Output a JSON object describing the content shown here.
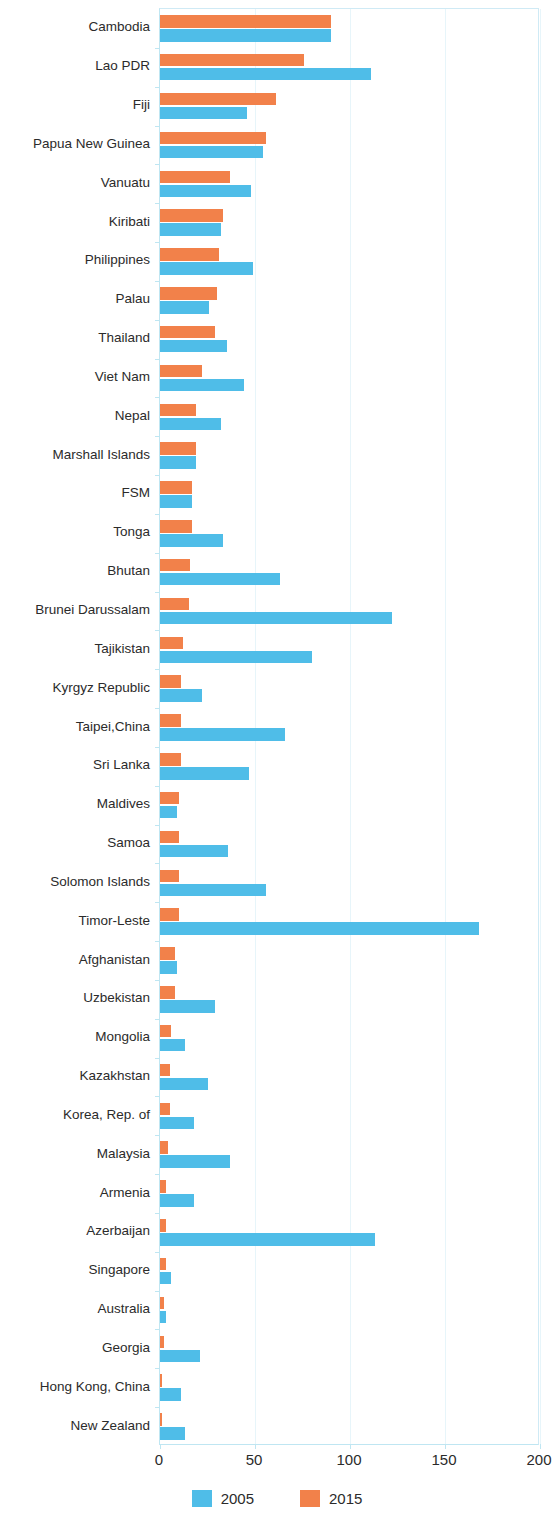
{
  "chart_data": {
    "type": "bar",
    "orientation": "horizontal",
    "title": "",
    "subtitle": "",
    "xlabel": "",
    "ylabel": "",
    "xlim": [
      0,
      200
    ],
    "xticks": [
      0,
      50,
      100,
      150,
      200
    ],
    "xtick_labels": [
      "0",
      "50",
      "100",
      "150",
      "200"
    ],
    "grid": true,
    "legend_position": "bottom-center",
    "colors": {
      "2005": "#4fbde8",
      "2015": "#f2814a",
      "axis": "#bfe6f2",
      "grid": "#e7f5fa",
      "text": "#2b2b2b"
    },
    "categories": [
      "Cambodia",
      "Lao PDR",
      "Fiji",
      "Papua New Guinea",
      "Vanuatu",
      "Kiribati",
      "Philippines",
      "Palau",
      "Thailand",
      "Viet Nam",
      "Nepal",
      "Marshall Islands",
      "FSM",
      "Tonga",
      "Bhutan",
      "Brunei Darussalam",
      "Tajikistan",
      "Kyrgyz Republic",
      "Taipei,China",
      "Sri Lanka",
      "Maldives",
      "Samoa",
      "Solomon Islands",
      "Timor-Leste",
      "Afghanistan",
      "Uzbekistan",
      "Mongolia",
      "Kazakhstan",
      "Korea, Rep. of",
      "Malaysia",
      "Armenia",
      "Azerbaijan",
      "Singapore",
      "Australia",
      "Georgia",
      "Hong Kong, China",
      "New Zealand"
    ],
    "series": [
      {
        "name": "2015",
        "color": "#f2814a",
        "values": [
          90,
          76,
          61,
          56,
          37,
          33,
          31,
          30,
          29,
          22,
          19,
          19,
          17,
          17,
          16,
          15,
          12,
          11,
          11,
          11,
          10,
          10,
          10,
          10,
          8,
          8,
          6,
          5,
          5,
          4,
          3,
          3,
          3,
          2,
          2,
          1,
          1
        ]
      },
      {
        "name": "2005",
        "color": "#4fbde8",
        "values": [
          90,
          111,
          46,
          54,
          48,
          32,
          49,
          26,
          35,
          44,
          32,
          19,
          17,
          33,
          63,
          122,
          80,
          22,
          66,
          47,
          9,
          36,
          56,
          168,
          9,
          29,
          13,
          25,
          18,
          37,
          18,
          113,
          6,
          3,
          21,
          11,
          13
        ]
      }
    ]
  },
  "legend": {
    "items": [
      {
        "label": "2005",
        "color": "#4fbde8"
      },
      {
        "label": "2015",
        "color": "#f2814a"
      }
    ]
  }
}
